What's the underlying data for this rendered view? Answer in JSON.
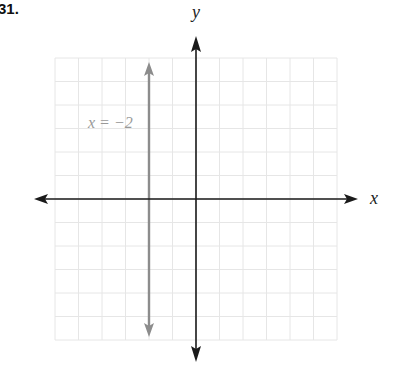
{
  "problem_number": "31.",
  "chart_data": {
    "type": "line",
    "title": "",
    "xlabel": "x",
    "ylabel": "y",
    "xlim": [
      -6,
      6
    ],
    "ylim": [
      -6,
      6
    ],
    "grid": true,
    "grid_color": "#e6e6e6",
    "axis_color": "#1a1a1a",
    "series": [
      {
        "name": "x = -2",
        "type": "vertical-line",
        "x": -2,
        "color": "#8c8c8c",
        "points": [
          [
            -2,
            -6
          ],
          [
            -2,
            6
          ]
        ]
      }
    ],
    "annotations": [
      {
        "text": "x = −2",
        "x": -4,
        "y": 4.5
      }
    ]
  }
}
